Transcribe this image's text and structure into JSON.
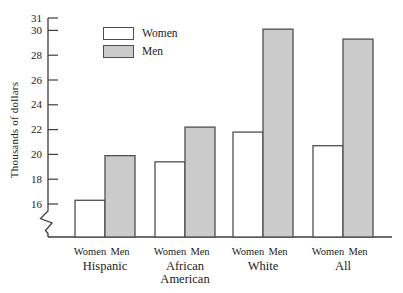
{
  "figure": {
    "background": "#ffffff"
  },
  "colors": {
    "women_fill": "#ffffff",
    "men_fill": "#cbcbcb",
    "bar_stroke": "#4f4f4f",
    "axis": "#3c3c3c",
    "text": "#222222"
  },
  "chart_data": {
    "type": "bar",
    "title": "",
    "xlabel": "",
    "ylabel": "Thousands of dollars",
    "ylim": [
      16,
      31
    ],
    "yticks": [
      16,
      18,
      20,
      22,
      24,
      26,
      28,
      30,
      31
    ],
    "axis_break": true,
    "grid": false,
    "legend_position": "top-left",
    "categories": [
      "Hispanic",
      "African American",
      "White",
      "All"
    ],
    "bar_sublabels": [
      "Women",
      "Men"
    ],
    "series": [
      {
        "name": "Women",
        "values": [
          16.3,
          19.4,
          21.8,
          20.7
        ]
      },
      {
        "name": "Men",
        "values": [
          19.9,
          22.2,
          30.1,
          29.3
        ]
      }
    ]
  }
}
